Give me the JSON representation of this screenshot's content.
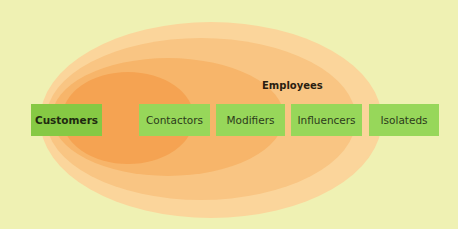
{
  "diagram": {
    "group_label": "Employees",
    "categories": [
      {
        "label": "Customers",
        "emphasis": true
      },
      {
        "label": "Contactors",
        "emphasis": false
      },
      {
        "label": "Modifiers",
        "emphasis": false
      },
      {
        "label": "Influencers",
        "emphasis": false
      },
      {
        "label": "Isolateds",
        "emphasis": false
      }
    ],
    "colors": {
      "background": "#eff1b3",
      "box": "#97d75a",
      "box_primary": "#86c944",
      "ellipse_outer": "#fbd59b",
      "ellipse_inner": "#f5a352"
    }
  }
}
